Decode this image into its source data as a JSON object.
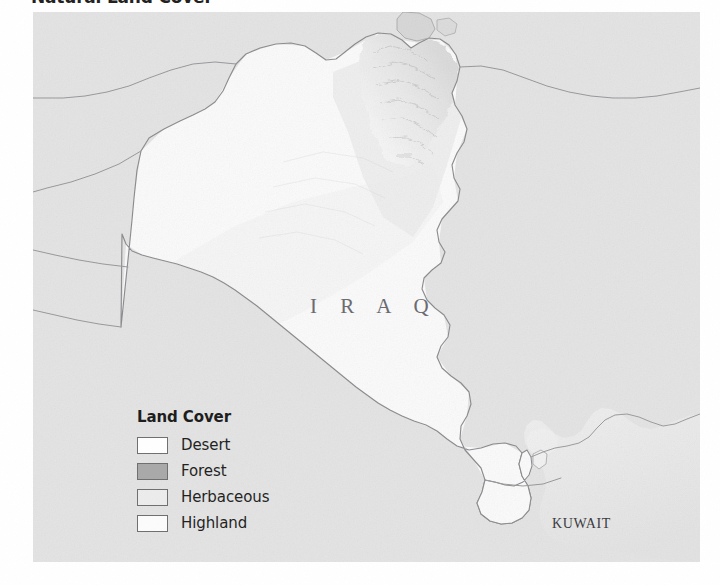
{
  "figure": {
    "title": "Natural Land Cover"
  },
  "map": {
    "country_labels": [
      {
        "name": "iraq",
        "text": "I R A Q"
      },
      {
        "name": "kuwait",
        "text": "KUWAIT"
      }
    ],
    "colors": {
      "neighbor_fill": "#e4e4e4",
      "iraq_desert": "#fbfbfb",
      "iraq_highland": "#f4f4f4",
      "herbaceous": "#ededed",
      "forest": "#a9a9a9",
      "water": "#f7f7f7",
      "border_line": "#8e8e92",
      "coast_line": "#9a9a9e"
    }
  },
  "legend": {
    "title": "Land Cover",
    "items": [
      {
        "label": "Desert",
        "swatch": "#ffffff",
        "swatch_name": "desert-swatch"
      },
      {
        "label": "Forest",
        "swatch": "#a9a9a9",
        "swatch_name": "forest-swatch"
      },
      {
        "label": "Herbaceous",
        "swatch": "#ececec",
        "swatch_name": "herbaceous-swatch"
      },
      {
        "label": "Highland",
        "swatch": "#fcfcfc",
        "swatch_name": "highland-swatch"
      }
    ]
  }
}
